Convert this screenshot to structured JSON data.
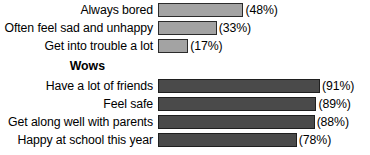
{
  "chart_data": {
    "type": "bar",
    "title": "",
    "subtitle": "",
    "xlabel": "",
    "ylabel": "",
    "orientation": "horizontal",
    "grid": false,
    "legend": false,
    "xlim": [
      0,
      100
    ],
    "value_suffix": "%",
    "groups": [
      {
        "heading": "",
        "bar_style": "light",
        "bar_color": "#a3a3a3",
        "items": [
          {
            "label": "Always bored",
            "value": 48,
            "value_label": "(48%)"
          },
          {
            "label": "Often feel sad and unhappy",
            "value": 33,
            "value_label": "(33%)"
          },
          {
            "label": "Get into trouble a lot",
            "value": 17,
            "value_label": "(17%)"
          }
        ]
      },
      {
        "heading": "Wows",
        "bar_style": "dark",
        "bar_color": "#4a4a4a",
        "items": [
          {
            "label": "Have a lot of friends",
            "value": 91,
            "value_label": "(91%)"
          },
          {
            "label": "Feel safe",
            "value": 89,
            "value_label": "(89%)"
          },
          {
            "label": "Get along well with parents",
            "value": 88,
            "value_label": "(88%)"
          },
          {
            "label": "Happy at school this year",
            "value": 78,
            "value_label": "(78%)"
          }
        ]
      }
    ]
  }
}
